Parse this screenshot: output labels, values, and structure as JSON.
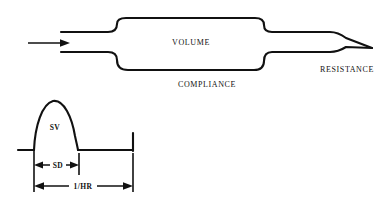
{
  "figure": {
    "top_diagram": {
      "labels": {
        "volume": "VOLUME",
        "compliance": "COMPLIANCE",
        "resistance": "RESISTANCE"
      },
      "inflow_arrow": "inflow-arrow-right"
    },
    "bottom_diagram": {
      "labels": {
        "stroke_volume": "SV",
        "systolic_duration": "SD",
        "cycle_length": "1/HR"
      },
      "arrows": {
        "sd_arrow": "double-headed-arrow",
        "hr_arrow": "double-headed-arrow"
      }
    },
    "colors": {
      "ink": "#111111",
      "background": "#ffffff"
    }
  }
}
